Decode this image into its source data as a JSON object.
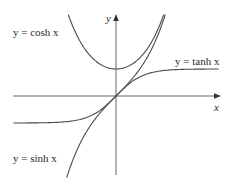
{
  "chart_data": {
    "type": "line",
    "title": "",
    "xlabel": "x",
    "ylabel": "y",
    "grid": false,
    "legend": "inline labels",
    "xlim": [
      -3.8,
      3.8
    ],
    "ylim": [
      -3.0,
      3.1
    ],
    "series": [
      {
        "name": "y = cosh x",
        "function": "cosh",
        "label_position": "upper-left",
        "x": [
          -2.0,
          -1.5,
          -1.0,
          -0.5,
          0,
          0.5,
          1.0,
          1.5,
          2.0
        ],
        "y": [
          3.76,
          2.35,
          1.54,
          1.13,
          1.0,
          1.13,
          1.54,
          2.35,
          3.76
        ]
      },
      {
        "name": "y = tanh x",
        "function": "tanh",
        "label_position": "right",
        "x": [
          -3.8,
          -2,
          -1,
          -0.5,
          0,
          0.5,
          1,
          2,
          3.8
        ],
        "y": [
          -1.0,
          -0.96,
          -0.76,
          -0.46,
          0,
          0.46,
          0.76,
          0.96,
          1.0
        ]
      },
      {
        "name": "y = sinh x",
        "function": "sinh",
        "label_position": "lower-left",
        "x": [
          -2.0,
          -1.5,
          -1.0,
          -0.5,
          0,
          0.5,
          1.0,
          1.5,
          2.0
        ],
        "y": [
          -3.63,
          -2.13,
          -1.18,
          -0.52,
          0,
          0.52,
          1.18,
          2.13,
          3.63
        ]
      }
    ]
  },
  "labels": {
    "cosh": "y = cosh x",
    "tanh": "y = tanh x",
    "sinh": "y = sinh x",
    "x_axis": "x",
    "y_axis": "y"
  },
  "style": {
    "curve_color": "#4a4a4a",
    "axis_color": "#555555",
    "background": "#ffffff"
  }
}
